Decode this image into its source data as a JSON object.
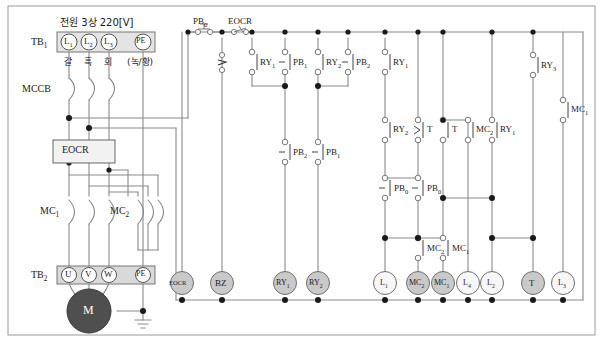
{
  "diagram": {
    "power_supply_label": "전원 3상 220[V]",
    "terminal_block_1": {
      "name": "TB",
      "sub": "1",
      "terminals": [
        "L",
        "L",
        "L",
        "PE"
      ],
      "terminal_subs": [
        "1",
        "2",
        "3",
        ""
      ],
      "wire_colors": [
        "갈",
        "흑",
        "회",
        "(녹/황)"
      ]
    },
    "terminal_block_2": {
      "name": "TB",
      "sub": "2",
      "terminals": [
        "U",
        "V",
        "W",
        "PE"
      ]
    },
    "breaker_label": "MCCB",
    "eocr_box_label": "EOCR",
    "motor_label": "M",
    "contactors": [
      {
        "name": "MC",
        "sub": "1"
      },
      {
        "name": "MC",
        "sub": "2"
      }
    ],
    "control_top": [
      {
        "name": "PB",
        "sub": "0"
      },
      {
        "name": "EOCR",
        "sub": ""
      }
    ],
    "contacts": [
      {
        "id": "c-ry1-top",
        "name": "RY",
        "sub": "1"
      },
      {
        "id": "c-pb1-top",
        "name": "PB",
        "sub": "1"
      },
      {
        "id": "c-ry2-top",
        "name": "RY",
        "sub": "2"
      },
      {
        "id": "c-pb2-top",
        "name": "PB",
        "sub": "2"
      },
      {
        "id": "c-ry1-top2",
        "name": "RY",
        "sub": "1"
      },
      {
        "id": "c-ry3-top",
        "name": "RY",
        "sub": "3"
      },
      {
        "id": "c-mc1-right",
        "name": "MC",
        "sub": "1"
      },
      {
        "id": "c-pb2-mid",
        "name": "PB",
        "sub": "2"
      },
      {
        "id": "c-pb1-mid",
        "name": "PB",
        "sub": "1"
      },
      {
        "id": "c-ry2-mid",
        "name": "RY",
        "sub": "2"
      },
      {
        "id": "c-t-mid",
        "name": "T",
        "sub": ""
      },
      {
        "id": "c-t-mid2",
        "name": "T",
        "sub": ""
      },
      {
        "id": "c-mc2-mid",
        "name": "MC",
        "sub": "2"
      },
      {
        "id": "c-ry1-mid",
        "name": "RY",
        "sub": "1"
      },
      {
        "id": "c-pb0-lo1",
        "name": "PB",
        "sub": "0"
      },
      {
        "id": "c-pb0-lo2",
        "name": "PB",
        "sub": "0"
      },
      {
        "id": "c-mc2-lo",
        "name": "MC",
        "sub": "2"
      },
      {
        "id": "c-mc1-lo",
        "name": "MC",
        "sub": "1"
      }
    ],
    "loads": [
      {
        "id": "ld-eocr",
        "label": "EOCR",
        "sub": "",
        "filled": true
      },
      {
        "id": "ld-bz",
        "label": "BZ",
        "sub": "",
        "filled": true
      },
      {
        "id": "ld-ry1",
        "label": "RY",
        "sub": "1",
        "filled": true
      },
      {
        "id": "ld-ry2",
        "label": "RY",
        "sub": "2",
        "filled": true
      },
      {
        "id": "ld-l1",
        "label": "L",
        "sub": "1",
        "filled": false
      },
      {
        "id": "ld-mc2",
        "label": "MC",
        "sub": "2",
        "filled": true
      },
      {
        "id": "ld-mc1",
        "label": "MC",
        "sub": "1",
        "filled": true
      },
      {
        "id": "ld-l4",
        "label": "L",
        "sub": "4",
        "filled": false
      },
      {
        "id": "ld-l2",
        "label": "L",
        "sub": "2",
        "filled": false
      },
      {
        "id": "ld-t",
        "label": "T",
        "sub": "",
        "filled": true
      },
      {
        "id": "ld-l3",
        "label": "L",
        "sub": "3",
        "filled": false
      }
    ],
    "colors": {
      "wire": "#8a8a8a",
      "ink": "#1a1a1a",
      "fill_light": "#f0f0f0",
      "fill_mid": "#c9c9c9",
      "fill_dark": "#5a5a5a",
      "border": "#777777"
    }
  }
}
